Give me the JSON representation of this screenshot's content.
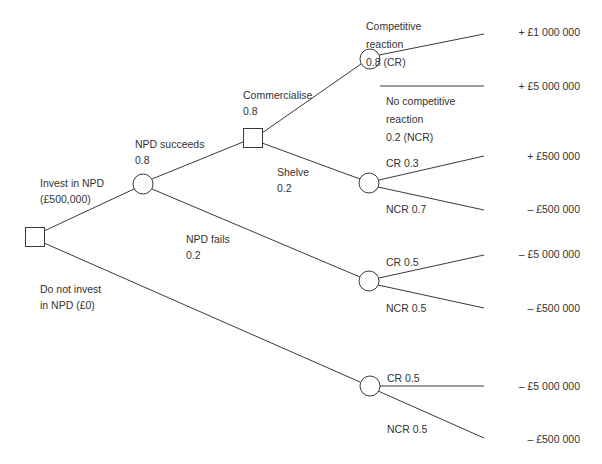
{
  "diagram": {
    "type": "decision-tree",
    "nodes": {
      "root": {
        "kind": "decision"
      },
      "npd_outcome": {
        "kind": "chance"
      },
      "commercialise_decision": {
        "kind": "decision"
      },
      "commercialise_reaction": {
        "kind": "chance"
      },
      "shelve_reaction": {
        "kind": "chance"
      },
      "fail_reaction": {
        "kind": "chance"
      },
      "noinvest_reaction": {
        "kind": "chance"
      }
    },
    "branches": {
      "invest": {
        "line1": "Invest in NPD",
        "line2": "(£500,000)"
      },
      "do_not_invest": {
        "line1": "Do not invest",
        "line2": "in NPD (£0)"
      },
      "npd_succeeds": {
        "line1": "NPD succeeds",
        "line2": "0.8"
      },
      "npd_fails": {
        "line1": "NPD fails",
        "line2": "0.2"
      },
      "commercialise": {
        "line1": "Commercialise",
        "line2": "0.8"
      },
      "shelve": {
        "line1": "Shelve",
        "line2": "0.2"
      },
      "comm_cr": {
        "line1": "Competitive",
        "line2": "reaction",
        "line3": "0.8 (CR)"
      },
      "comm_ncr": {
        "line1": "No competitive",
        "line2": "reaction",
        "line3": "0.2 (NCR)"
      },
      "shelve_cr": {
        "label": "CR 0.3"
      },
      "shelve_ncr": {
        "label": "NCR 0.7"
      },
      "fail_cr": {
        "label": "CR 0.5"
      },
      "fail_ncr": {
        "label": "NCR 0.5"
      },
      "noinvest_cr": {
        "label": "CR 0.5"
      },
      "noinvest_ncr": {
        "label": "NCR 0.5"
      }
    },
    "payoffs": [
      "+ £1 000 000",
      "+ £5 000 000",
      "+ £500 000",
      "– £500 000",
      "– £5 000 000",
      "– £500 000",
      "– £5 000 000",
      "– £500 000"
    ],
    "colors": {
      "line": "#3a3a3a",
      "node_fill": "#ffffff",
      "text": "#333333"
    }
  }
}
